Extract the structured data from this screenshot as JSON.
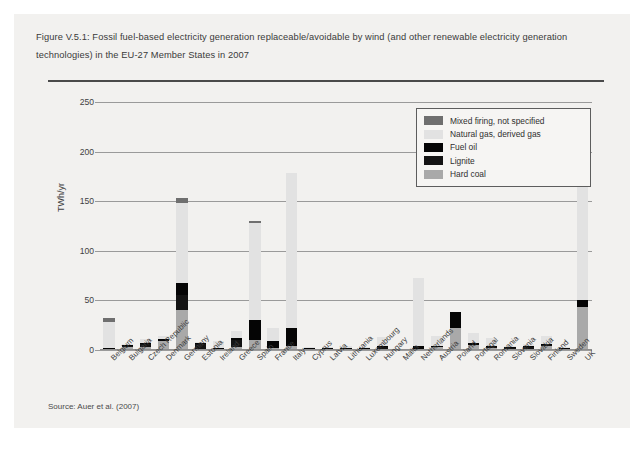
{
  "figure": {
    "caption": "Figure V.5.1: Fossil fuel-based electricity generation replaceable/avoidable by wind (and other renewable electricity generation technologies) in the EU-27 Member States in 2007",
    "source": "Source: Auer et al. (2007)"
  },
  "legend": {
    "position": "top-right-inside",
    "items": [
      {
        "label": "Mixed firing, not specified",
        "color": "#6f6f6f",
        "key": "mixed"
      },
      {
        "label": "Natural gas, derived gas",
        "color": "#e2e2e2",
        "key": "gas"
      },
      {
        "label": "Fuel oil",
        "color": "#050505",
        "key": "fueloil"
      },
      {
        "label": "Lignite",
        "color": "#141414",
        "key": "lignite"
      },
      {
        "label": "Hard coal",
        "color": "#a9a9a9",
        "key": "hardcoal"
      }
    ]
  },
  "chart_data": {
    "type": "bar",
    "subtype": "stacked",
    "title": "Figure V.5.1: Fossil fuel-based electricity generation replaceable/avoidable by wind (and other renewable electricity generation technologies) in the EU-27 Member States in 2007",
    "xlabel": "",
    "ylabel": "TWh/yr",
    "ylim": [
      0,
      250
    ],
    "yticks": [
      0,
      50,
      100,
      150,
      200,
      250
    ],
    "ytick_labels": [
      "0",
      "50",
      "100",
      "150",
      "200",
      "250"
    ],
    "grid": true,
    "grid_axis": "y",
    "categories": [
      "Belgium",
      "Bulgaria",
      "Czech Republic",
      "Denmark",
      "Germany",
      "Estonia",
      "Ireland",
      "Greece",
      "Spain",
      "France",
      "Italy",
      "Cyprus",
      "Latvia",
      "Lithuania",
      "Luxembourg",
      "Hungary",
      "Malta",
      "Netherlands",
      "Austria",
      "Poland",
      "Portugal",
      "Romania",
      "Slovenia",
      "Slovakia",
      "Finland",
      "Sweden",
      "UK"
    ],
    "series": [
      {
        "name": "Hard coal",
        "color": "#a9a9a9",
        "values": [
          1.5,
          3.0,
          3.5,
          9.0,
          40.0,
          0.5,
          1.5,
          3.0,
          10.0,
          2.0,
          4.0,
          0.0,
          0.5,
          0.3,
          0.3,
          1.5,
          0.0,
          1.5,
          3.0,
          22.0,
          5.0,
          2.0,
          1.0,
          1.5,
          4.0,
          1.0,
          43.0
        ]
      },
      {
        "name": "Lignite",
        "color": "#141414",
        "values": [
          0.0,
          1.0,
          2.5,
          0.0,
          15.0,
          5.5,
          0.0,
          7.0,
          0.0,
          0.0,
          0.0,
          0.0,
          0.0,
          0.0,
          0.0,
          1.5,
          0.0,
          0.0,
          0.0,
          0.0,
          0.0,
          1.5,
          0.5,
          1.5,
          0.5,
          0.0,
          0.0
        ]
      },
      {
        "name": "Fuel oil",
        "color": "#050505",
        "values": [
          0.5,
          0.5,
          0.5,
          2.5,
          13.0,
          0.5,
          1.0,
          2.0,
          20.0,
          7.0,
          18.0,
          2.5,
          0.3,
          0.3,
          0.3,
          1.0,
          0.8,
          2.5,
          1.5,
          16.0,
          2.0,
          1.0,
          0.3,
          0.5,
          1.0,
          1.0,
          7.0
        ]
      },
      {
        "name": "Natural gas, derived gas",
        "color": "#e2e2e2",
        "values": [
          26.0,
          1.5,
          4.0,
          2.5,
          80.0,
          0.5,
          7.0,
          7.0,
          98.0,
          13.5,
          156.0,
          0.5,
          0.5,
          2.0,
          1.5,
          9.0,
          0.0,
          69.0,
          10.0,
          0.0,
          10.5,
          8.0,
          0.5,
          2.0,
          8.0,
          1.5,
          154.0
        ]
      },
      {
        "name": "Mixed firing, not specified",
        "color": "#6f6f6f",
        "values": [
          4.0,
          0.0,
          0.0,
          0.0,
          5.0,
          0.0,
          0.0,
          0.0,
          2.0,
          0.0,
          0.0,
          0.0,
          0.0,
          0.0,
          0.0,
          0.0,
          0.0,
          0.0,
          0.0,
          0.0,
          0.0,
          0.0,
          0.0,
          0.0,
          0.0,
          0.0,
          0.0
        ]
      }
    ],
    "totals": [
      32.0,
      6.0,
      10.5,
      14.0,
      153.0,
      7.0,
      9.5,
      19.0,
      130.0,
      22.5,
      178.0,
      3.0,
      1.3,
      2.6,
      2.1,
      13.0,
      0.8,
      73.0,
      14.5,
      38.0,
      17.5,
      12.5,
      2.3,
      5.5,
      13.5,
      3.5,
      204.0
    ]
  }
}
